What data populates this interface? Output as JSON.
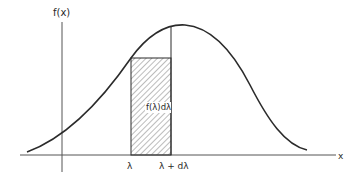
{
  "figure": {
    "y_axis_label": "f(x)",
    "x_axis_label": "x",
    "strip_left_label": "λ",
    "strip_right_label": "λ + dλ",
    "strip_area_label": "f(λ)dλ"
  },
  "colors": {
    "line": "#2b2b2b",
    "axis": "#555555",
    "hatch": "#7a7a7a"
  }
}
